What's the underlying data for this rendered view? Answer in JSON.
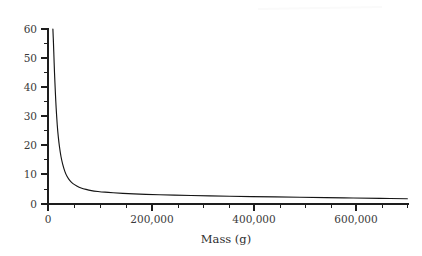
{
  "chart_data": {
    "type": "line",
    "title": "",
    "subtitle": "",
    "xlabel": "Mass (g)",
    "ylabel": "",
    "xlim": [
      0,
      665000
    ],
    "ylim": [
      0,
      60
    ],
    "grid": false,
    "legend": null,
    "x_ticks_major": [
      0,
      200000,
      400000,
      600000
    ],
    "x_tick_labels": [
      "0",
      "200,000",
      "400,000",
      "600,000"
    ],
    "x_ticks_minor_step": 50000,
    "y_ticks_major": [
      0,
      10,
      20,
      30,
      40,
      50,
      60
    ],
    "y_tick_labels": [
      "0",
      "10",
      "20",
      "30",
      "40",
      "50",
      "60"
    ],
    "y_ticks_minor_step": 5,
    "series": [
      {
        "name": "metabolic-rate-curve",
        "color": "#151515",
        "x": [
          9000,
          10000,
          11000,
          12000,
          13500,
          15000,
          17000,
          19000,
          21000,
          24000,
          27000,
          31000,
          35000,
          40000,
          46000,
          53000,
          61000,
          70000,
          80000,
          92000,
          105000,
          120000,
          138000,
          158000,
          180000,
          205000,
          233000,
          264000,
          298000,
          335000,
          375000,
          418000,
          464000,
          512000,
          562000,
          612000,
          662000
        ],
        "y": [
          60.0,
          55.5,
          50.2,
          45.0,
          38.5,
          33.0,
          27.2,
          23.0,
          19.8,
          16.2,
          13.7,
          11.2,
          9.5,
          8.1,
          7.0,
          6.2,
          5.5,
          5.0,
          4.6,
          4.3,
          4.05,
          3.85,
          3.65,
          3.48,
          3.32,
          3.18,
          3.04,
          2.9,
          2.78,
          2.66,
          2.54,
          2.42,
          2.3,
          2.18,
          2.05,
          1.93,
          1.8
        ]
      }
    ]
  }
}
